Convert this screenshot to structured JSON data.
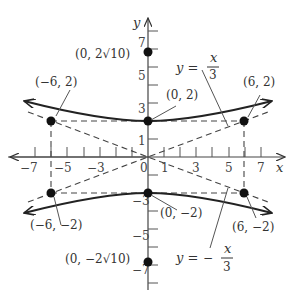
{
  "figure": {
    "type": "hyperbola-graph",
    "equation_implied": "y^2/4 - x^2/36 = 1",
    "axes": {
      "x_label": "x",
      "y_label": "y",
      "x_ticks": [
        "-7",
        "-5",
        "-3",
        "-1",
        "1",
        "3",
        "5",
        "7"
      ],
      "x_tick_labels_shown": [
        "−7",
        "−5",
        "−3",
        "1",
        "3",
        "5",
        "7"
      ],
      "y_ticks_shown": [
        "7",
        "5",
        "3",
        "1",
        "−3",
        "−5",
        "−7"
      ],
      "x_range": [
        -8,
        8
      ],
      "y_range": [
        -8,
        8
      ]
    },
    "points": [
      {
        "label": "(0, 2√10)",
        "x": 0,
        "y": 6.32
      },
      {
        "label": "(0, 2)",
        "x": 0,
        "y": 2
      },
      {
        "label": "(−6, 2)",
        "x": -6,
        "y": 2
      },
      {
        "label": "(6, 2)",
        "x": 6,
        "y": 2
      },
      {
        "label": "(−6, −2)",
        "x": -6,
        "y": -2
      },
      {
        "label": "(0, −2)",
        "x": 0,
        "y": -2
      },
      {
        "label": "(6, −2)",
        "x": 6,
        "y": -2
      },
      {
        "label": "(0, −2√10)",
        "x": 0,
        "y": -6.32
      }
    ],
    "asymptotes": [
      {
        "label_y": "y =",
        "label_num": "x",
        "label_den": "3",
        "sign": "",
        "slope": 0.3333
      },
      {
        "label_y": "y =",
        "label_num": "x",
        "label_den": "3",
        "sign": "−",
        "slope": -0.3333
      }
    ]
  }
}
